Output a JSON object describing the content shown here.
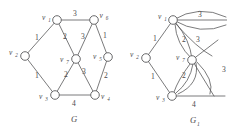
{
  "figure": {
    "title": "",
    "graphs": [
      {
        "caption": "G",
        "caption_sub": "",
        "vertices": [
          {
            "id": "v1",
            "label": "v",
            "sub": "1"
          },
          {
            "id": "v2",
            "label": "v",
            "sub": "2"
          },
          {
            "id": "v3",
            "label": "v",
            "sub": "3"
          },
          {
            "id": "v4",
            "label": "v",
            "sub": "4"
          },
          {
            "id": "v5",
            "label": "v",
            "sub": "5"
          },
          {
            "id": "v6",
            "label": "v",
            "sub": "6"
          },
          {
            "id": "v7",
            "label": "v",
            "sub": "7"
          }
        ],
        "edges": [
          {
            "from": "v1",
            "to": "v6",
            "weight": "3"
          },
          {
            "from": "v1",
            "to": "v2",
            "weight": "1"
          },
          {
            "from": "v1",
            "to": "v7",
            "weight": "2"
          },
          {
            "from": "v6",
            "to": "v7",
            "weight": "3"
          },
          {
            "from": "v6",
            "to": "v5",
            "weight": "1"
          },
          {
            "from": "v2",
            "to": "v3",
            "weight": "1"
          },
          {
            "from": "v7",
            "to": "v3",
            "weight": "2"
          },
          {
            "from": "v7",
            "to": "v4",
            "weight": "3"
          },
          {
            "from": "v5",
            "to": "v4",
            "weight": "2"
          },
          {
            "from": "v3",
            "to": "v4",
            "weight": "4"
          }
        ]
      },
      {
        "caption": "G",
        "caption_sub": "1",
        "vertices": [
          {
            "id": "v1",
            "label": "v",
            "sub": "1"
          },
          {
            "id": "v2",
            "label": "v",
            "sub": "2"
          },
          {
            "id": "v3",
            "label": "v",
            "sub": "3"
          },
          {
            "id": "v7",
            "label": "v",
            "sub": "7"
          }
        ],
        "edges": [
          {
            "from": "v1",
            "to": "v6",
            "weight": "3"
          },
          {
            "from": "v1",
            "to": "v2",
            "weight": "1"
          },
          {
            "from": "v1",
            "to": "v7",
            "weight": "2"
          },
          {
            "from": "v1",
            "to": "v6b",
            "weight": "3"
          },
          {
            "from": "v2",
            "to": "v3",
            "weight": "1"
          },
          {
            "from": "v7",
            "to": "v3",
            "weight": "2"
          },
          {
            "from": "v3",
            "to": "v4",
            "weight": "4"
          },
          {
            "from": "v7",
            "to": "v4",
            "weight": "3"
          }
        ]
      }
    ]
  },
  "labels": {
    "g_caption": "G",
    "g1_caption": "G",
    "g1_caption_sub": "1",
    "v1": "v",
    "v1s": "1",
    "v2": "v",
    "v2s": "2",
    "v3": "v",
    "v3s": "3",
    "v4": "v",
    "v4s": "4",
    "v5": "v",
    "v5s": "5",
    "v6": "v",
    "v6s": "6",
    "v7": "v",
    "v7s": "7",
    "w_top": "3",
    "w_left_upper": "1",
    "w_left_lower": "1",
    "w_diag_ul": "2",
    "w_diag_ur": "3",
    "w_diag_ll": "2",
    "w_diag_lr": "3",
    "w_right_upper": "1",
    "w_right_lower": "2",
    "w_bottom": "4",
    "g1_w_top": "3",
    "g1_w_left_upper": "1",
    "g1_w_left_lower": "1",
    "g1_w_diag_ul": "2",
    "g1_w_diag_ur": "3",
    "g1_w_diag_ll": "2",
    "g1_w_bottom": "4",
    "g1_w_right": "3"
  },
  "colors": {
    "stroke": "#59595b",
    "text": "#4a4a4c",
    "background": "#ffffff"
  }
}
